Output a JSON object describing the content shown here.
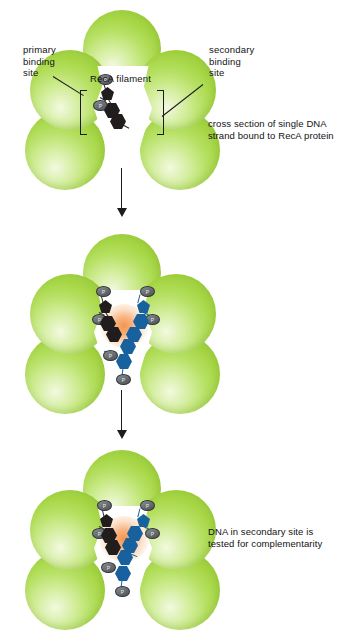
{
  "figure": {
    "sphere_color": "#a6d645",
    "strand_primary_color": "#201d1c",
    "strand_secondary_color": "#17619e",
    "phosphate_color": "#6c7176",
    "glow_color": "#f48e44",
    "phosphate_glyph": "P"
  },
  "panels": [
    {
      "id": "panel-1",
      "caption": "cross section of single DNA\nstrand bound to RecA protein",
      "labels": {
        "primary_binding_site": "primary\nbinding\nsite",
        "secondary_binding_site": "secondary\nbinding\nsite",
        "filament": "RecA filament"
      },
      "spheres": 5,
      "strands": [
        "primary"
      ],
      "has_glow": false
    },
    {
      "id": "panel-2",
      "caption": "DNA in secondary site is\ntested for complementarity",
      "spheres": 5,
      "strands": [
        "primary",
        "secondary"
      ],
      "has_glow": true
    },
    {
      "id": "panel-3",
      "caption": "base pairing between\nstrands is switched",
      "spheres": 5,
      "strands": [
        "primary",
        "secondary"
      ],
      "has_glow": true
    }
  ],
  "arrows": [
    {
      "id": "arrow-1",
      "direction": "down",
      "from": "panel-1",
      "to": "panel-2"
    },
    {
      "id": "arrow-2",
      "direction": "down",
      "from": "panel-2",
      "to": "panel-3"
    }
  ]
}
